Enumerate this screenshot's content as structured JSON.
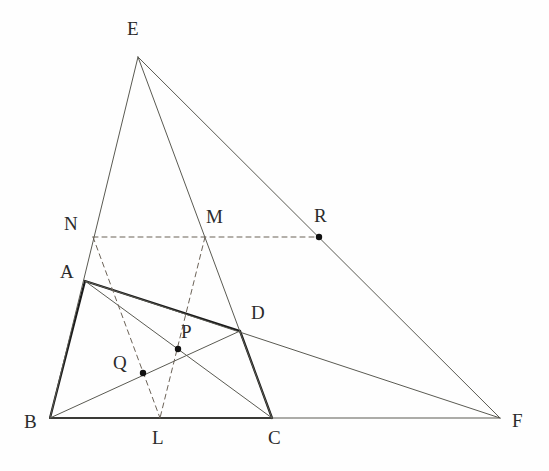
{
  "figure": {
    "canvas": {
      "width": 549,
      "height": 471
    },
    "colors": {
      "background": "#fefefe",
      "bold_stroke": "#1a1a1a",
      "thin_stroke": "#5a5a52",
      "dashed_stroke": "#6b6257",
      "label_text": "#2b2b2b",
      "point_marker": "#111111"
    },
    "stroke_widths": {
      "bold": 2.2,
      "thin": 1.0,
      "dashed": 1.0
    },
    "points": [
      {
        "id": "A",
        "label": "A",
        "x": 85,
        "y": 281,
        "label_x": 60,
        "label_y": 262,
        "marker": false
      },
      {
        "id": "B",
        "label": "B",
        "x": 50,
        "y": 418,
        "label_x": 24,
        "label_y": 412,
        "marker": false
      },
      {
        "id": "C",
        "label": "C",
        "x": 272,
        "y": 418,
        "label_x": 268,
        "label_y": 428,
        "marker": false
      },
      {
        "id": "D",
        "label": "D",
        "x": 240,
        "y": 331,
        "label_x": 251,
        "label_y": 303,
        "marker": false
      },
      {
        "id": "E",
        "label": "E",
        "x": 138,
        "y": 57,
        "label_x": 127,
        "label_y": 19,
        "marker": false
      },
      {
        "id": "F",
        "label": "F",
        "x": 500,
        "y": 418,
        "label_x": 512,
        "label_y": 411,
        "marker": false
      },
      {
        "id": "L",
        "label": "L",
        "x": 160,
        "y": 418,
        "label_x": 152,
        "label_y": 428,
        "marker": false
      },
      {
        "id": "M",
        "label": "M",
        "x": 205,
        "y": 237,
        "label_x": 206,
        "label_y": 207,
        "marker": false
      },
      {
        "id": "N",
        "label": "N",
        "x": 93,
        "y": 237,
        "label_x": 64,
        "label_y": 214,
        "marker": false
      },
      {
        "id": "P",
        "label": "P",
        "x": 178,
        "y": 349,
        "label_x": 181,
        "label_y": 322,
        "marker": true
      },
      {
        "id": "Q",
        "label": "Q",
        "x": 143,
        "y": 373,
        "label_x": 113,
        "label_y": 353,
        "marker": true
      },
      {
        "id": "R",
        "label": "R",
        "x": 319,
        "y": 237,
        "label_x": 314,
        "label_y": 206,
        "marker": true
      }
    ],
    "segments": [
      {
        "name": "segment-A-B",
        "from": "A",
        "to": "B",
        "style": "bold"
      },
      {
        "name": "segment-A-D",
        "from": "A",
        "to": "D",
        "style": "bold"
      },
      {
        "name": "segment-D-C",
        "from": "D",
        "to": "C",
        "style": "bold"
      },
      {
        "name": "segment-B-C",
        "from": "B",
        "to": "C",
        "style": "bold"
      },
      {
        "name": "segment-E-B",
        "from": "E",
        "to": "B",
        "style": "thin"
      },
      {
        "name": "segment-E-C",
        "from": "E",
        "to": "C",
        "style": "thin"
      },
      {
        "name": "segment-E-F",
        "from": "E",
        "to": "F",
        "style": "thin"
      },
      {
        "name": "segment-B-F",
        "from": "B",
        "to": "F",
        "style": "thin"
      },
      {
        "name": "segment-A-F",
        "from": "A",
        "to": "F",
        "style": "thin"
      },
      {
        "name": "segment-B-D",
        "from": "B",
        "to": "D",
        "style": "thin"
      },
      {
        "name": "segment-A-C",
        "from": "A",
        "to": "C",
        "style": "thin"
      },
      {
        "name": "segment-N-R",
        "from": "N",
        "to": "R",
        "style": "dashed"
      },
      {
        "name": "segment-N-L",
        "from": "N",
        "to": "L",
        "style": "dashed"
      },
      {
        "name": "segment-M-L",
        "from": "M",
        "to": "L",
        "style": "dashed"
      }
    ]
  }
}
